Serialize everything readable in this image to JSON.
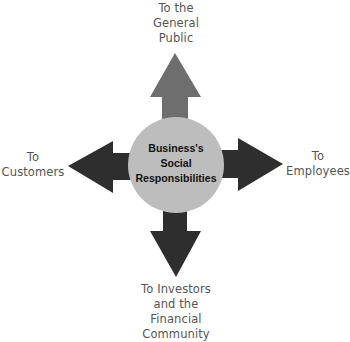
{
  "diagram": {
    "title": "Business's Social Responsibilities",
    "center": {
      "label": "Business's\nSocial\nResponsibilities",
      "fill": "#bdbdbd"
    },
    "arrows": [
      {
        "direction": "up",
        "label": "To the\nGeneral\nPublic",
        "color": "#6e6e6e"
      },
      {
        "direction": "left",
        "label": "To\nCustomers",
        "color": "#2e2e2e"
      },
      {
        "direction": "right",
        "label": "To\nEmployees",
        "color": "#2e2e2e"
      },
      {
        "direction": "down",
        "label": "To Investors\nand the\nFinancial\nCommunity",
        "color": "#2e2e2e"
      }
    ]
  }
}
